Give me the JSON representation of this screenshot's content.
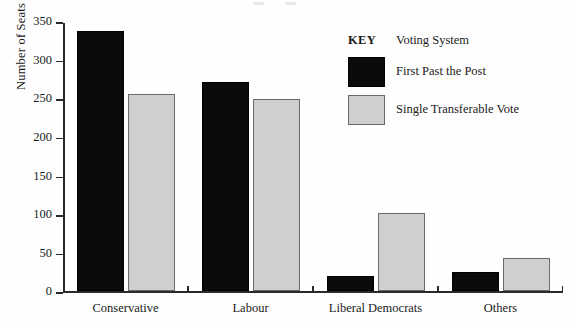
{
  "chart_data": {
    "type": "bar",
    "title": "",
    "xlabel": "",
    "ylabel": "Number of Seats",
    "categories": [
      "Conservative",
      "Labour",
      "Liberal Democrats",
      "Others"
    ],
    "series": [
      {
        "name": "First Past the Post",
        "color": "#0b0b0b",
        "values": [
          338,
          272,
          20,
          25
        ]
      },
      {
        "name": "Single Transferable Vote",
        "color": "#cfcfcf",
        "values": [
          256,
          250,
          102,
          43
        ]
      }
    ],
    "ylim": [
      0,
      350
    ],
    "yticks": [
      0,
      50,
      100,
      150,
      200,
      250,
      300,
      350
    ],
    "ytick_labels": [
      "0",
      "50",
      "100",
      "150",
      "200",
      "250",
      "300",
      "350"
    ],
    "grid": false,
    "legend_position": "top-right"
  },
  "legend": {
    "key_label": "KEY",
    "title": "Voting System",
    "entries": [
      {
        "label": "First Past the Post",
        "swatch": "black-swatch"
      },
      {
        "label": "Single Transferable Vote",
        "swatch": "gray-swatch"
      }
    ]
  }
}
